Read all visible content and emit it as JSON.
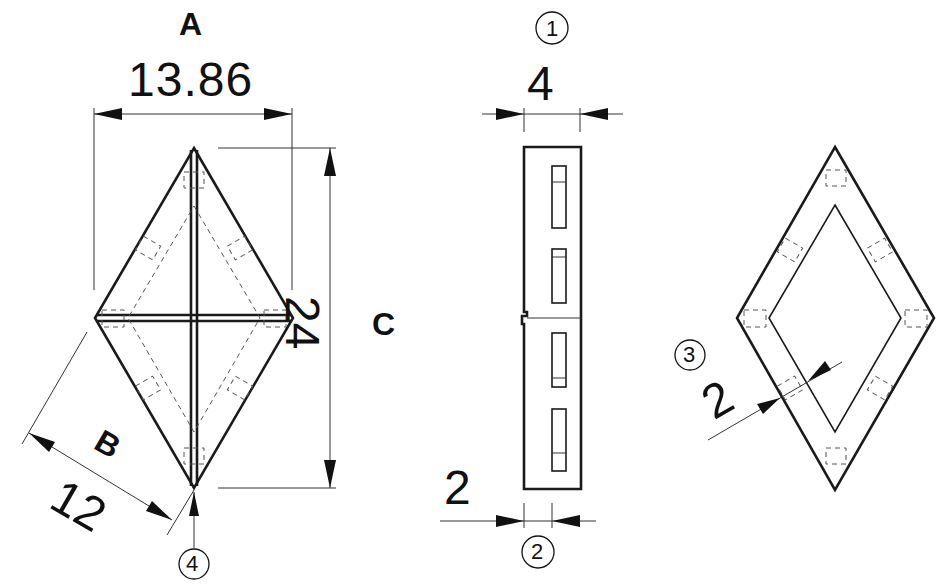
{
  "drawing": {
    "type": "technical-drawing",
    "subject": "rhombus frame part drawing",
    "views": [
      {
        "id": "front",
        "description": "rhombus with cross bars (front view)"
      },
      {
        "id": "side",
        "description": "side edge view with slots"
      },
      {
        "id": "frame",
        "description": "rhombus ring frame"
      }
    ]
  },
  "labels": {
    "A": "A",
    "B": "B",
    "C": "C"
  },
  "dimensions": {
    "width_A": "13.86",
    "side_B": "12",
    "height_C": "24",
    "thickness_1": "4",
    "slot_2": "2",
    "frame_width_3": "2"
  },
  "callouts": {
    "c1": "1",
    "c2": "2",
    "c3": "3",
    "c4": "4"
  }
}
